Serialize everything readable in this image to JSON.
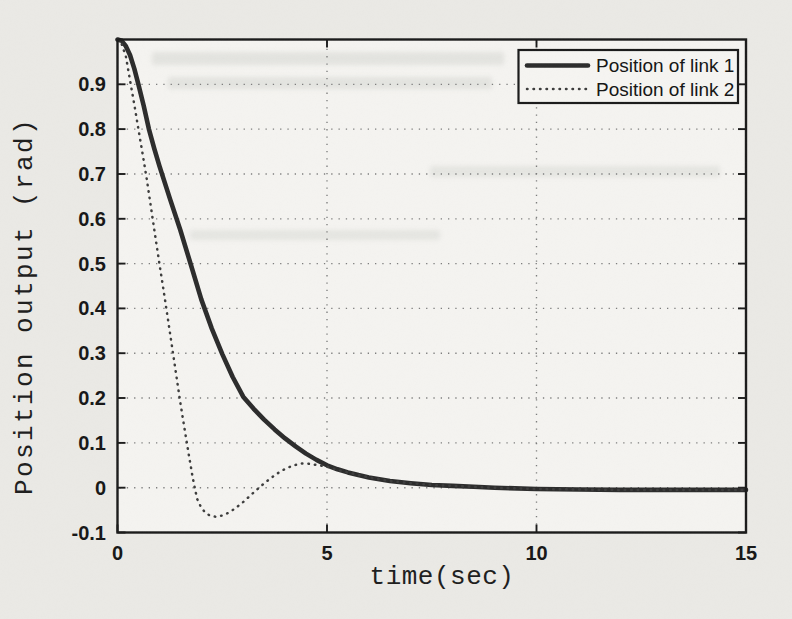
{
  "chart_data": {
    "type": "line",
    "title": "",
    "xlabel": "time(sec)",
    "ylabel": "Position output (rad)",
    "xlim": [
      0,
      15
    ],
    "ylim": [
      -0.1,
      1.0
    ],
    "x_tick_values": [
      0,
      5,
      10,
      15
    ],
    "x_tick_labels": [
      "0",
      "5",
      "10",
      "15"
    ],
    "y_tick_values": [
      -0.1,
      0,
      0.1,
      0.2,
      0.3,
      0.4,
      0.5,
      0.6,
      0.7,
      0.8,
      0.9
    ],
    "y_tick_labels": [
      "-0.1",
      "0",
      "0.1",
      "0.2",
      "0.3",
      "0.4",
      "0.5",
      "0.6",
      "0.7",
      "0.8",
      "0.9"
    ],
    "grid": "dotted",
    "grid_x": [
      5,
      10
    ],
    "grid_y": [
      0,
      0.1,
      0.2,
      0.3,
      0.4,
      0.5,
      0.6,
      0.7,
      0.8,
      0.9
    ],
    "legend": {
      "position": "top-right"
    },
    "series": [
      {
        "name": "Position of link 1",
        "style": "solid",
        "color": "#2b2b2b",
        "points": [
          [
            0,
            1.0
          ],
          [
            0.1,
            0.997
          ],
          [
            0.2,
            0.985
          ],
          [
            0.3,
            0.965
          ],
          [
            0.4,
            0.935
          ],
          [
            0.5,
            0.9
          ],
          [
            0.625,
            0.852
          ],
          [
            0.75,
            0.8
          ],
          [
            0.875,
            0.757
          ],
          [
            1.0,
            0.718
          ],
          [
            1.25,
            0.645
          ],
          [
            1.5,
            0.575
          ],
          [
            1.75,
            0.498
          ],
          [
            2.0,
            0.42
          ],
          [
            2.25,
            0.355
          ],
          [
            2.5,
            0.298
          ],
          [
            2.75,
            0.247
          ],
          [
            3.0,
            0.203
          ],
          [
            3.25,
            0.176
          ],
          [
            3.5,
            0.152
          ],
          [
            3.75,
            0.13
          ],
          [
            4.0,
            0.11
          ],
          [
            4.25,
            0.092
          ],
          [
            4.5,
            0.076
          ],
          [
            4.75,
            0.062
          ],
          [
            5.0,
            0.05
          ],
          [
            5.25,
            0.041
          ],
          [
            5.5,
            0.034
          ],
          [
            5.75,
            0.028
          ],
          [
            6.0,
            0.023
          ],
          [
            6.5,
            0.015
          ],
          [
            7.0,
            0.01
          ],
          [
            7.5,
            0.006
          ],
          [
            8.0,
            0.004
          ],
          [
            8.5,
            0.002
          ],
          [
            9.0,
            0.0
          ],
          [
            10.0,
            -0.003
          ],
          [
            11.0,
            -0.004
          ],
          [
            12.0,
            -0.005
          ],
          [
            13.0,
            -0.005
          ],
          [
            14.0,
            -0.005
          ],
          [
            15.0,
            -0.005
          ]
        ]
      },
      {
        "name": "Position of link 2",
        "style": "dotted",
        "color": "#3c3c3c",
        "points": [
          [
            0,
            1.0
          ],
          [
            0.1,
            0.99
          ],
          [
            0.2,
            0.962
          ],
          [
            0.3,
            0.908
          ],
          [
            0.4,
            0.855
          ],
          [
            0.5,
            0.8
          ],
          [
            0.6,
            0.745
          ],
          [
            0.7,
            0.688
          ],
          [
            0.8,
            0.625
          ],
          [
            0.9,
            0.562
          ],
          [
            1.0,
            0.5
          ],
          [
            1.1,
            0.44
          ],
          [
            1.2,
            0.378
          ],
          [
            1.3,
            0.315
          ],
          [
            1.4,
            0.252
          ],
          [
            1.5,
            0.19
          ],
          [
            1.6,
            0.132
          ],
          [
            1.7,
            0.075
          ],
          [
            1.8,
            0.02
          ],
          [
            1.9,
            -0.025
          ],
          [
            2.0,
            -0.045
          ],
          [
            2.1,
            -0.056
          ],
          [
            2.2,
            -0.062
          ],
          [
            2.35,
            -0.065
          ],
          [
            2.5,
            -0.062
          ],
          [
            2.65,
            -0.056
          ],
          [
            2.8,
            -0.047
          ],
          [
            3.0,
            -0.032
          ],
          [
            3.2,
            -0.015
          ],
          [
            3.4,
            0.002
          ],
          [
            3.6,
            0.017
          ],
          [
            3.8,
            0.031
          ],
          [
            4.0,
            0.042
          ],
          [
            4.2,
            0.05
          ],
          [
            4.4,
            0.054
          ],
          [
            4.6,
            0.053
          ],
          [
            4.8,
            0.05
          ],
          [
            5.0,
            0.047
          ],
          [
            5.25,
            0.04
          ],
          [
            5.5,
            0.034
          ],
          [
            5.75,
            0.028
          ],
          [
            6.0,
            0.023
          ],
          [
            6.5,
            0.015
          ],
          [
            7.0,
            0.01
          ],
          [
            7.5,
            0.006
          ],
          [
            8.0,
            0.004
          ],
          [
            8.5,
            0.002
          ],
          [
            9.0,
            0.0
          ],
          [
            10.0,
            -0.003
          ],
          [
            11.0,
            -0.004
          ],
          [
            12.0,
            -0.005
          ],
          [
            13.0,
            -0.005
          ],
          [
            14.0,
            -0.005
          ],
          [
            15.0,
            -0.005
          ]
        ]
      }
    ]
  },
  "colors": {
    "paper": "#ebeae6",
    "plot_background": "#f5f4f1",
    "frame": "#1a1a1a",
    "grid": "#7d7d7d",
    "solid_curve": "#2b2b2b",
    "dotted_curve": "#3c3c3c"
  }
}
